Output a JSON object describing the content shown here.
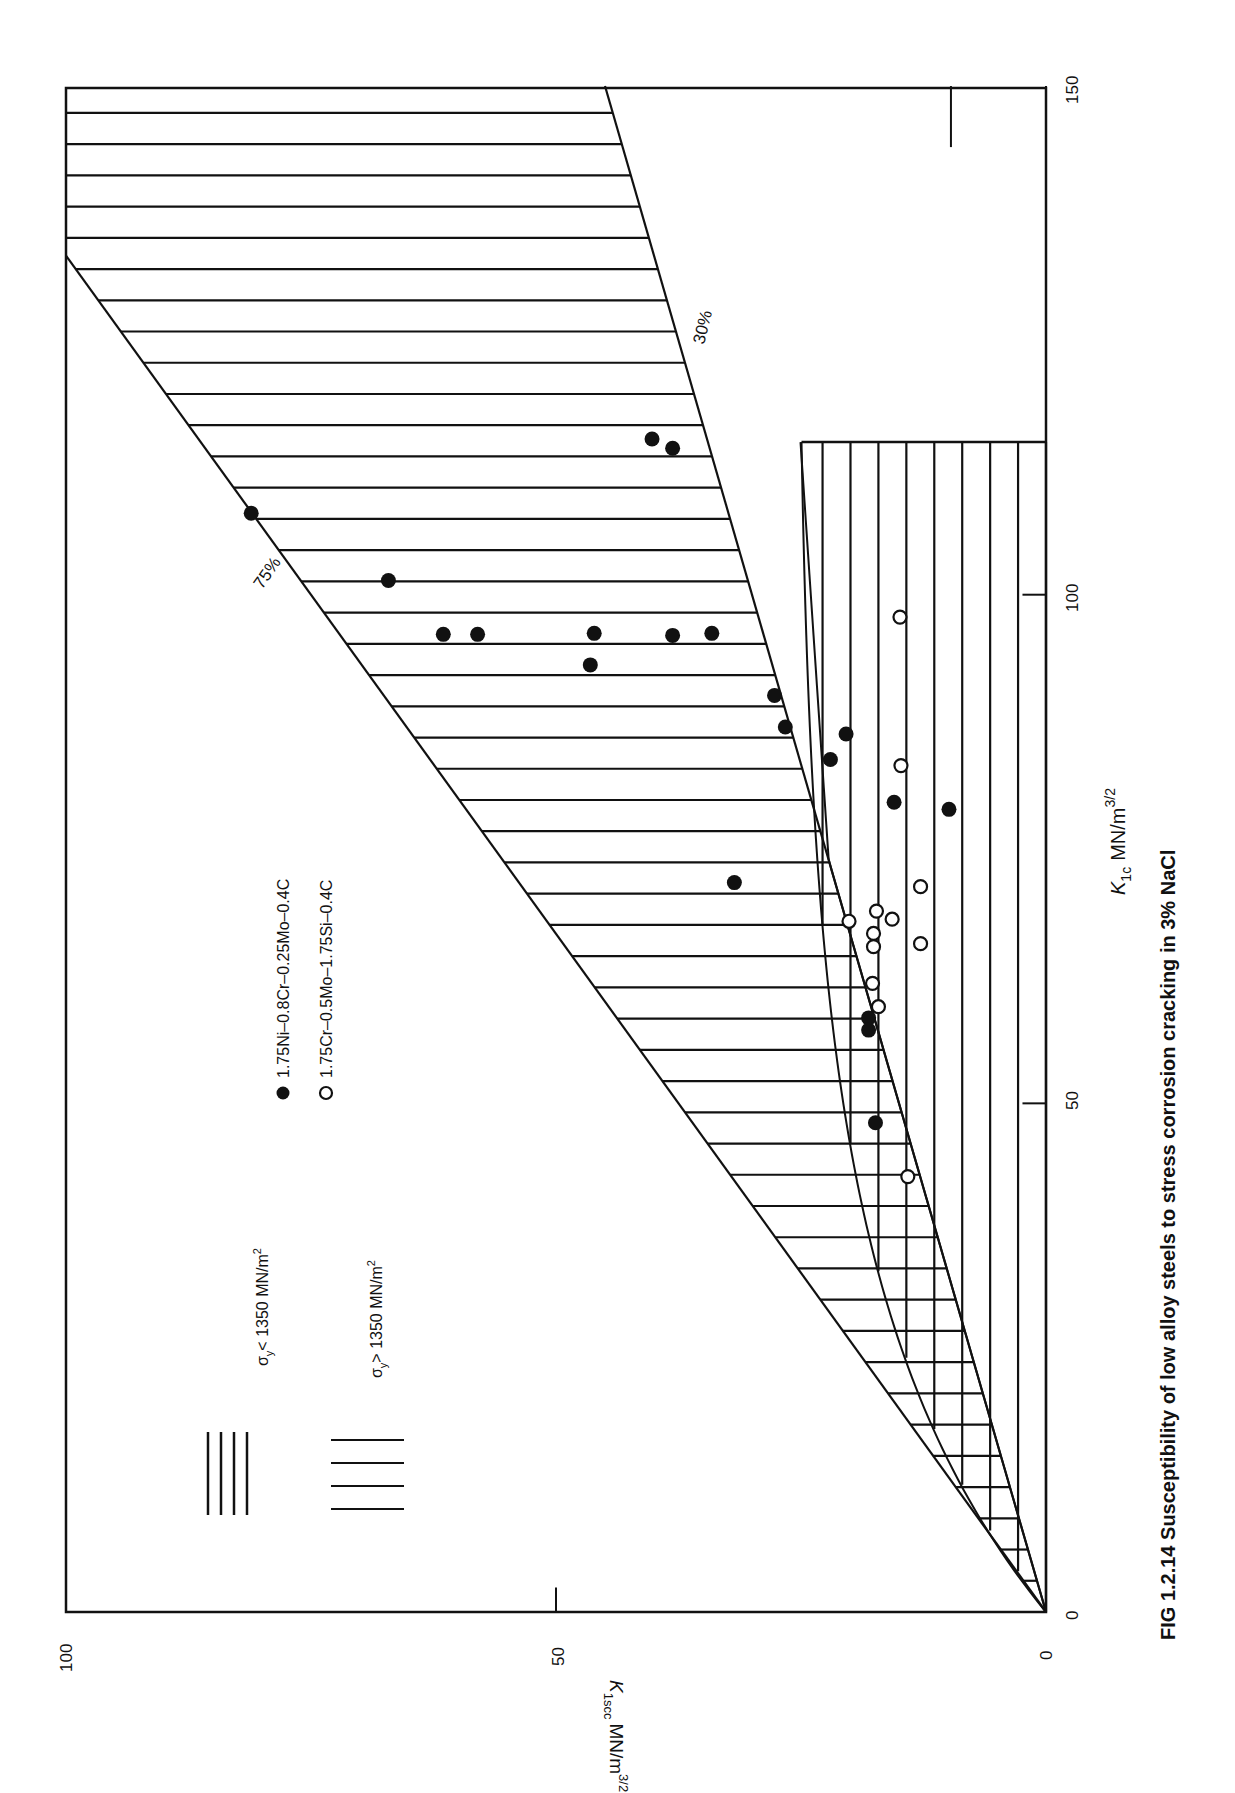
{
  "page": {
    "running_header_partial": "...",
    "caption": "FIG 1.2.14 Susceptibility of low alloy steels to stress corrosion cracking in 3% NaCl"
  },
  "chart_data": {
    "type": "scatter",
    "orientation": "rotated 90 degrees counter-clockwise on the page",
    "title": "FIG 1.2.14 Susceptibility of low alloy steels to stress corrosion cracking in 3% NaCl",
    "xlabel": "K1c MN/m^3/2",
    "xlabel_main": "K",
    "xlabel_sub": "1c",
    "xlabel_unit": "MN/m",
    "xlabel_sup": "3/2",
    "ylabel": "K1scc MN/m^3/2",
    "ylabel_main": "K",
    "ylabel_sub": "1scc",
    "ylabel_unit": "MN/m",
    "ylabel_sup": "3/2",
    "xlim": [
      0,
      150
    ],
    "ylim": [
      0,
      100
    ],
    "xticks": [
      "0",
      "50",
      "100",
      "150"
    ],
    "yticks": [
      "0",
      "50",
      "100"
    ],
    "grid": false,
    "reference_lines": [
      {
        "label": "75%",
        "slope": 0.75
      },
      {
        "label": "30%",
        "slope": 0.3
      }
    ],
    "hatched_regions": [
      {
        "label": "σy < 1350 MN/m²",
        "label_prefix": "σ",
        "label_sub": "y",
        "label_rest": "< 1350 MN/m",
        "label_sup": "2",
        "description": "band between 30% and 75% lines, hatched parallel to K1scc axis"
      },
      {
        "label": "σy > 1350 MN/m²",
        "label_prefix": "σ",
        "label_sub": "y",
        "label_rest": "> 1350 MN/m",
        "label_sup": "2",
        "description": "low K1scc region up to K1c ≈ 115, hatched parallel to K1c axis"
      }
    ],
    "legend": [
      {
        "marker": "filled-circle",
        "label": "1.75Ni–0.8Cr–0.25Mo–0.4C"
      },
      {
        "marker": "open-circle",
        "label": "1.75Cr–0.5Mo–1.75Si–0.4C"
      }
    ],
    "series": [
      {
        "name": "1.75Ni–0.8Cr–0.25Mo–0.4C",
        "marker": "filled-circle",
        "points": [
          {
            "x": 108.0,
            "y": 81.1
          },
          {
            "x": 115.3,
            "y": 40.2
          },
          {
            "x": 114.4,
            "y": 38.1
          },
          {
            "x": 101.4,
            "y": 67.1
          },
          {
            "x": 96.1,
            "y": 61.5
          },
          {
            "x": 96.1,
            "y": 58.0
          },
          {
            "x": 96.2,
            "y": 46.1
          },
          {
            "x": 96.0,
            "y": 38.1
          },
          {
            "x": 96.2,
            "y": 34.1
          },
          {
            "x": 93.1,
            "y": 46.5
          },
          {
            "x": 90.1,
            "y": 27.7
          },
          {
            "x": 87.0,
            "y": 26.6
          },
          {
            "x": 86.3,
            "y": 20.4
          },
          {
            "x": 83.8,
            "y": 22.0
          },
          {
            "x": 79.6,
            "y": 15.5
          },
          {
            "x": 78.9,
            "y": 9.9
          },
          {
            "x": 71.7,
            "y": 31.8
          },
          {
            "x": 58.4,
            "y": 18.1
          },
          {
            "x": 57.2,
            "y": 18.1
          },
          {
            "x": 48.1,
            "y": 17.4
          }
        ]
      },
      {
        "name": "1.75Cr–0.5Mo–1.75Si–0.4C",
        "marker": "open-circle",
        "points": [
          {
            "x": 97.8,
            "y": 14.9
          },
          {
            "x": 83.2,
            "y": 14.8
          },
          {
            "x": 71.3,
            "y": 12.8
          },
          {
            "x": 68.9,
            "y": 17.3
          },
          {
            "x": 68.1,
            "y": 15.7
          },
          {
            "x": 67.9,
            "y": 20.1
          },
          {
            "x": 66.7,
            "y": 17.6
          },
          {
            "x": 65.4,
            "y": 17.6
          },
          {
            "x": 65.7,
            "y": 12.8
          },
          {
            "x": 61.8,
            "y": 17.7
          },
          {
            "x": 59.5,
            "y": 17.1
          },
          {
            "x": 42.8,
            "y": 14.1
          }
        ]
      }
    ]
  }
}
